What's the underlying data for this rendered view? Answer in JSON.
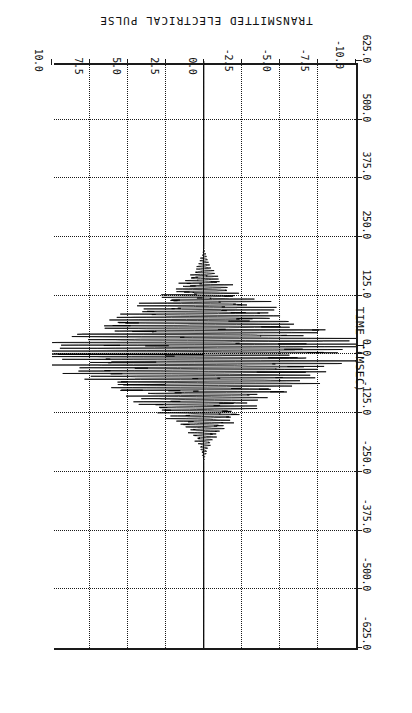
{
  "chart_data": {
    "type": "line",
    "title": "TRANSMITTED ELECTRICAL PULSE",
    "xlabel": "TIME T(MSEC)",
    "ylabel": "",
    "orientation": "rotated-180",
    "grid": "dotted-both-axes",
    "zero_line": "solid",
    "xlim": [
      -625.0,
      625.0
    ],
    "ylim": [
      -10.0,
      10.0
    ],
    "xticks": [
      -625.0,
      -500.0,
      -375.0,
      -250.0,
      -125.0,
      0.0,
      125.0,
      250.0,
      375.0,
      500.0,
      625.0
    ],
    "xticklabels": [
      "-625.0",
      "-500.0",
      "-375.0",
      "-250.0",
      "-125.0",
      "0.0",
      "125.0",
      "250.0",
      "375.0",
      "500.0",
      "625.0"
    ],
    "yticks": [
      -10.0,
      -7.5,
      -5.0,
      -2.5,
      0.0,
      2.5,
      5.0,
      7.5,
      10.0
    ],
    "yticklabels": [
      "-10.0",
      "-7.5",
      "-5.0",
      "-2.5",
      "0.0",
      "2.5",
      "5.0",
      "7.5",
      "10.0"
    ],
    "series": [
      {
        "name": "transmitted electrical pulse",
        "envelope_peak": 9.6,
        "envelope_center_ms": 0.0,
        "envelope_half_width_ms": 230.0,
        "carrier_period_ms": 6.0,
        "spike_amplitude": 9.6,
        "spike_width_ms": 3.0
      }
    ]
  },
  "axes": {
    "time_axis_label": "TIME T(MSEC)",
    "time_ticks": [
      "625.0",
      "500.0",
      "375.0",
      "250.0",
      "125.0",
      "0.0",
      "-125.0",
      "-250.0",
      "-375.0",
      "-500.0",
      "-625.0"
    ],
    "amplitude_ticks": [
      "10.0",
      "7.5",
      "5.0",
      "2.5",
      "0.0",
      "-2.5",
      "-5.0",
      "-7.5",
      "-10.0"
    ]
  },
  "colors": {
    "ink": "#1a1a1a",
    "background": "#ffffff",
    "trace": "#000000"
  }
}
